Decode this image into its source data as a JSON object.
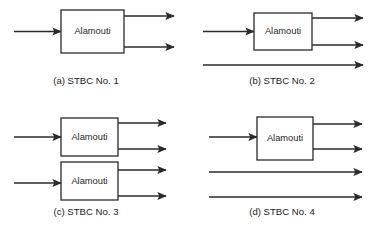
{
  "figure": {
    "title": "",
    "background_color": "#ffffff",
    "line_color": "#2a2a2a",
    "text_color": "#1a1a1a",
    "block_label": "Alamouti",
    "panels": [
      {
        "id": "a",
        "caption": "(a) STBC No. 1",
        "caption_x": 86,
        "caption_y": 84,
        "blocks": [
          {
            "label": "Alamouti",
            "x": 61,
            "y": 10,
            "width": 63,
            "height": 43
          }
        ],
        "inputs": [
          {
            "x1": 14,
            "y": 31.5,
            "x2": 61
          }
        ],
        "outputs": [
          {
            "x1": 124,
            "y": 16,
            "x2": 174
          },
          {
            "x1": 124,
            "y": 47,
            "x2": 174
          }
        ],
        "passthroughs": []
      },
      {
        "id": "b",
        "caption": "(b) STBC No. 2",
        "caption_x": 282,
        "caption_y": 84,
        "blocks": [
          {
            "label": "Alamouti",
            "x": 254,
            "y": 13,
            "width": 58,
            "height": 37
          }
        ],
        "inputs": [
          {
            "x1": 203,
            "y": 31.5,
            "x2": 254
          }
        ],
        "outputs": [
          {
            "x1": 312,
            "y": 18,
            "x2": 363
          },
          {
            "x1": 312,
            "y": 45,
            "x2": 363
          }
        ],
        "passthroughs": [
          {
            "x1": 203,
            "y": 65,
            "x2": 363
          }
        ]
      },
      {
        "id": "c",
        "caption": "(c) STBC No. 3",
        "caption_x": 86,
        "caption_y": 215,
        "blocks": [
          {
            "label": "Alamouti",
            "x": 61,
            "y": 118,
            "width": 57,
            "height": 38
          },
          {
            "label": "Alamouti",
            "x": 61,
            "y": 162,
            "width": 57,
            "height": 38
          }
        ],
        "inputs": [
          {
            "x1": 14,
            "y": 137,
            "x2": 61
          },
          {
            "x1": 14,
            "y": 183,
            "x2": 61
          }
        ],
        "outputs": [
          {
            "x1": 118,
            "y": 123,
            "x2": 166
          },
          {
            "x1": 118,
            "y": 149,
            "x2": 166
          },
          {
            "x1": 118,
            "y": 170,
            "x2": 166
          },
          {
            "x1": 118,
            "y": 196,
            "x2": 166
          }
        ],
        "passthroughs": []
      },
      {
        "id": "d",
        "caption": "(d) STBC No. 4",
        "caption_x": 282,
        "caption_y": 215,
        "blocks": [
          {
            "label": "Alamouti",
            "x": 257,
            "y": 117,
            "width": 56,
            "height": 43
          }
        ],
        "inputs": [
          {
            "x1": 209,
            "y": 137,
            "x2": 257
          }
        ],
        "outputs": [
          {
            "x1": 313,
            "y": 124,
            "x2": 362
          },
          {
            "x1": 313,
            "y": 149,
            "x2": 362
          }
        ],
        "passthroughs": [
          {
            "x1": 209,
            "y": 172,
            "x2": 362
          },
          {
            "x1": 209,
            "y": 197,
            "x2": 362
          }
        ]
      }
    ]
  }
}
